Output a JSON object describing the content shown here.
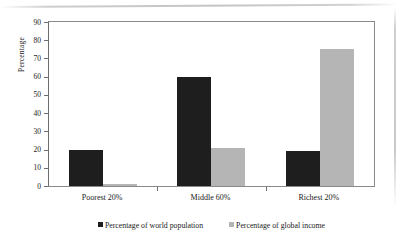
{
  "chart_data": {
    "type": "bar",
    "title": "",
    "subtitle": "",
    "xlabel": "",
    "ylabel": "Percentage",
    "ylim": [
      0,
      90
    ],
    "ytick_step": 10,
    "yticks": [
      90,
      80,
      70,
      60,
      50,
      40,
      30,
      20,
      10,
      0
    ],
    "grid": false,
    "legend_position": "bottom-center",
    "categories": [
      "Poorest 20%",
      "Middle 60%",
      "Richest 20%"
    ],
    "series": [
      {
        "name": "Percentage of world population",
        "color": "#1e1e1e",
        "values": [
          20,
          60,
          19
        ]
      },
      {
        "name": "Percentage of global income",
        "color": "#b5b5b5",
        "values": [
          1,
          21,
          75
        ]
      }
    ]
  },
  "legend": {
    "items": [
      {
        "label": "Percentage of world population",
        "swatch": "series-pop"
      },
      {
        "label": "Percentage of global income",
        "swatch": "series-inc"
      }
    ]
  },
  "colors": {
    "series_population": "#1e1e1e",
    "series_income": "#b5b5b5",
    "axis": "#6d6d6d",
    "frame": "#8a8a8a",
    "background": "#ffffff"
  }
}
